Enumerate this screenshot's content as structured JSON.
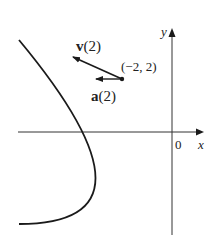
{
  "figure": {
    "type": "parametric-curve-with-vectors",
    "curve": "parabola opening left, vertex at origin (x = -y^2/2)",
    "axes": {
      "x_label": "x",
      "y_label": "y",
      "origin_label": "0"
    },
    "point": {
      "label": "(−2, 2)",
      "x": -2,
      "y": 2
    },
    "vectors": [
      {
        "name": "velocity",
        "label_bold": "v",
        "label_arg": "(2)",
        "direction": "tangent, pointing up-left"
      },
      {
        "name": "acceleration",
        "label_bold": "a",
        "label_arg": "(2)",
        "direction": "horizontal, pointing left"
      }
    ],
    "colors": {
      "curve": "#1a1a1a",
      "axes": "#333333",
      "text": "#222222"
    }
  }
}
